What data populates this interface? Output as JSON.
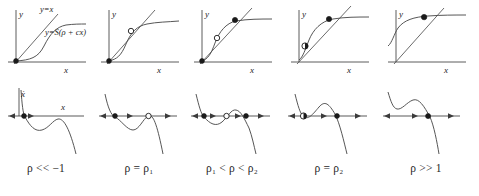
{
  "figure": {
    "name": "bifurcation-diagram-sigmoid-fixed-points",
    "columns": [
      {
        "caption": "ρ << −1",
        "caption_plain": "rho much less than -1",
        "top": {
          "y_axis_label": "y",
          "x_axis_label": "x",
          "identity_label": "y=x",
          "curve_label": "y=S(ρ + cx)",
          "fixed_points": [
            {
              "type": "stable",
              "marker": "filled",
              "x": 0.07,
              "y": 0.07
            }
          ]
        },
        "bottom": {
          "y_axis_label": "ẋ",
          "x_axis_label": "x",
          "fixed_points": [
            {
              "type": "stable",
              "marker": "filled",
              "x": 0.17
            }
          ],
          "flow_arrows": [
            "right",
            "left"
          ]
        }
      },
      {
        "caption": "ρ = ρ₁",
        "caption_plain": "rho equals rho one",
        "top": {
          "y_axis_label": "y",
          "x_axis_label": "x",
          "identity_label": "",
          "curve_label": "",
          "fixed_points": [
            {
              "type": "stable",
              "marker": "filled",
              "x": 0.08,
              "y": 0.08
            },
            {
              "type": "semistable",
              "marker": "open",
              "x": 0.45,
              "y": 0.45
            }
          ]
        },
        "bottom": {
          "y_axis_label": "",
          "x_axis_label": "",
          "fixed_points": [
            {
              "type": "stable",
              "marker": "filled",
              "x": 0.22
            },
            {
              "type": "semistable",
              "marker": "open",
              "x": 0.6
            }
          ],
          "flow_arrows": [
            "right",
            "left",
            "right"
          ]
        }
      },
      {
        "caption": "ρ₁ < ρ < ρ₂",
        "caption_plain": "rho one less than rho less than rho two",
        "top": {
          "y_axis_label": "y",
          "x_axis_label": "x",
          "identity_label": "",
          "curve_label": "",
          "fixed_points": [
            {
              "type": "stable",
              "marker": "filled",
              "x": 0.1,
              "y": 0.1
            },
            {
              "type": "unstable",
              "marker": "open",
              "x": 0.4,
              "y": 0.4
            },
            {
              "type": "stable",
              "marker": "filled",
              "x": 0.7,
              "y": 0.7
            }
          ]
        },
        "bottom": {
          "y_axis_label": "",
          "x_axis_label": "",
          "fixed_points": [
            {
              "type": "stable",
              "marker": "filled",
              "x": 0.16
            },
            {
              "type": "unstable",
              "marker": "open",
              "x": 0.47
            },
            {
              "type": "stable",
              "marker": "filled",
              "x": 0.7
            }
          ],
          "flow_arrows": [
            "right",
            "left",
            "right",
            "left"
          ]
        }
      },
      {
        "caption": "ρ = ρ₂",
        "caption_plain": "rho equals rho two",
        "top": {
          "y_axis_label": "y",
          "x_axis_label": "x",
          "identity_label": "",
          "curve_label": "",
          "fixed_points": [
            {
              "type": "semistable",
              "marker": "half",
              "x": 0.16,
              "y": 0.16
            },
            {
              "type": "stable",
              "marker": "filled",
              "x": 0.66,
              "y": 0.66
            }
          ]
        },
        "bottom": {
          "y_axis_label": "",
          "x_axis_label": "",
          "fixed_points": [
            {
              "type": "semistable",
              "marker": "half",
              "x": 0.23
            },
            {
              "type": "stable",
              "marker": "filled",
              "x": 0.6
            }
          ],
          "flow_arrows": [
            "right",
            "right",
            "left"
          ]
        }
      },
      {
        "caption": "ρ >> 1",
        "caption_plain": "rho much greater than 1",
        "top": {
          "y_axis_label": "y",
          "x_axis_label": "x",
          "identity_label": "",
          "curve_label": "",
          "fixed_points": [
            {
              "type": "stable",
              "marker": "filled",
              "x": 0.62,
              "y": 0.62
            }
          ]
        },
        "bottom": {
          "y_axis_label": "",
          "x_axis_label": "",
          "fixed_points": [
            {
              "type": "stable",
              "marker": "filled",
              "x": 0.6
            }
          ],
          "flow_arrows": [
            "right",
            "right",
            "left"
          ]
        }
      }
    ]
  },
  "colors": {
    "axis": "#4a4a4a",
    "curve": "#4d4d4d",
    "marker_fill": "#1a1a1a",
    "marker_open": "#ffffff",
    "background": "#ffffff",
    "text": "#1f1f1f"
  }
}
